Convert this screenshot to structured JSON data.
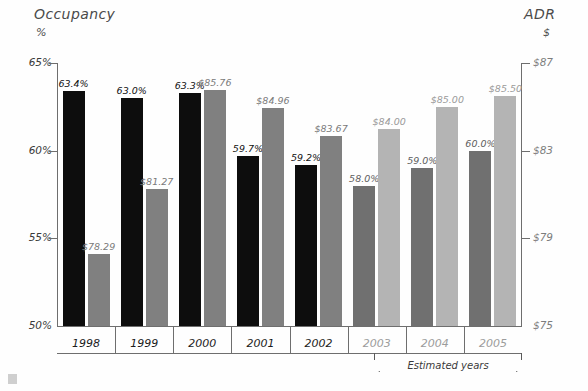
{
  "chart_data": {
    "type": "bar",
    "title": "",
    "categories": [
      "1998",
      "1999",
      "2000",
      "2001",
      "2002",
      "2003",
      "2004",
      "2005"
    ],
    "series": [
      {
        "name": "Occupancy",
        "unit": "%",
        "axis": "left",
        "values": [
          63.4,
          63.0,
          63.3,
          59.7,
          59.2,
          58.0,
          59.0,
          60.0
        ],
        "labels": [
          "63.4%",
          "63.0%",
          "63.3%",
          "59.7%",
          "59.2%",
          "58.0%",
          "59.0%",
          "60.0%"
        ],
        "color": "#0d0d0d",
        "estimated_color": "#707070"
      },
      {
        "name": "ADR",
        "unit": "$",
        "axis": "right",
        "values": [
          78.29,
          81.27,
          85.76,
          84.96,
          83.67,
          84.0,
          85.0,
          85.5
        ],
        "labels": [
          "$78.29",
          "$81.27",
          "$85.76",
          "$84.96",
          "$83.67",
          "$84.00",
          "$85.00",
          "$85.50"
        ],
        "color": "#808080",
        "estimated_color": "#b4b4b4"
      }
    ],
    "left_axis": {
      "label": "Occupancy",
      "unit": "%",
      "ticks": [
        "65%",
        "60%",
        "55%",
        "50%"
      ],
      "tick_values": [
        65,
        60,
        55,
        50
      ],
      "ylim": [
        50,
        65
      ]
    },
    "right_axis": {
      "label": "ADR",
      "unit": "$",
      "ticks": [
        "$87",
        "$83",
        "$79",
        "$75"
      ],
      "tick_values": [
        87,
        83,
        79,
        75
      ],
      "ylim": [
        75,
        87
      ]
    },
    "annotations": [
      {
        "text": "Estimated years",
        "covers": [
          "2003",
          "2004",
          "2005"
        ]
      }
    ],
    "estimated_categories": [
      "2003",
      "2004",
      "2005"
    ],
    "grid": false,
    "legend": "none"
  }
}
